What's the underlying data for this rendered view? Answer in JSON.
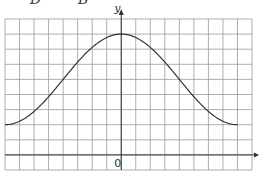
{
  "header": {
    "fragment_left": "D",
    "fragment_right": "B"
  },
  "graph": {
    "y_axis_label": "y",
    "origin_label": "0",
    "grid_color": "#9a9a9a",
    "axis_color": "#333333",
    "curve_color": "#333333"
  },
  "chart_data": {
    "type": "line",
    "title": "",
    "xlabel": "",
    "ylabel": "y",
    "grid": true,
    "grid_columns": 17,
    "grid_rows": 10,
    "y_axis_column": 8,
    "x_axis_row_from_top": 9,
    "series": [
      {
        "name": "curve",
        "x": [
          -8,
          -7,
          -6,
          -5,
          -4,
          -3,
          -2,
          -1,
          0,
          1,
          2,
          3,
          4,
          5,
          6,
          7,
          8
        ],
        "y": [
          2.0,
          2.4,
          3.3,
          4.4,
          5.6,
          6.6,
          7.4,
          7.9,
          8.0,
          7.9,
          7.4,
          6.6,
          5.6,
          4.4,
          3.3,
          2.4,
          2.0
        ]
      }
    ]
  }
}
